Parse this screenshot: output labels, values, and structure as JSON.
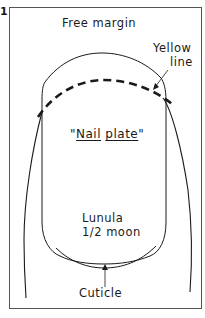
{
  "figure": {
    "number": "1",
    "labels": {
      "free_margin": "Free margin",
      "yellow_line_1": "Yellow",
      "yellow_line_2": "line",
      "nail_plate_open_quote": "\"",
      "nail_plate_word1": "Nail",
      "nail_plate_space": " ",
      "nail_plate_word2": "plate",
      "nail_plate_close_quote": "\"",
      "lunula_1": "Lunula",
      "lunula_2": "1/2 moon",
      "cuticle": "Cuticle"
    },
    "colors": {
      "ink": "#1a1a1a",
      "frame": "#555555",
      "background": "#ffffff"
    }
  }
}
